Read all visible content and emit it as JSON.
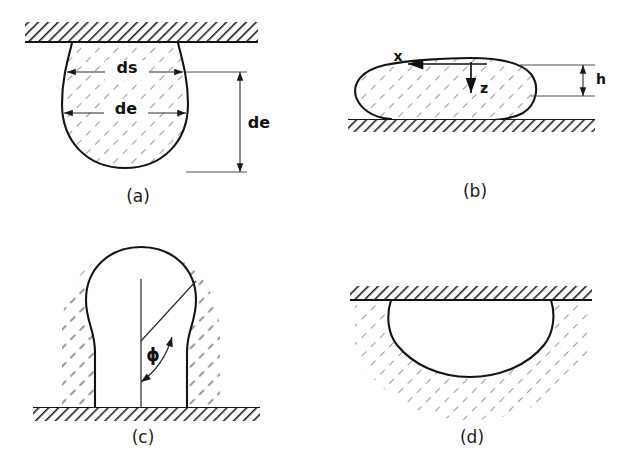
{
  "figure": {
    "width": 623,
    "height": 463,
    "background_color": "#ffffff",
    "outline_color": "#141414",
    "hatch_solid_color": "#1a1a1a",
    "hatch_fluid_color": "#9a9a9a"
  },
  "panels": [
    {
      "id": "a",
      "caption": "(a)",
      "description": "Pendant drop hanging from a horizontal solid surface",
      "labels": [
        {
          "name": "ds",
          "text": "ds"
        },
        {
          "name": "de-horizontal",
          "text": "de"
        },
        {
          "name": "de-vertical",
          "text": "de"
        }
      ]
    },
    {
      "id": "b",
      "caption": "(b)",
      "description": "Sessile drop resting on a horizontal solid surface with coordinate axes",
      "labels": [
        {
          "name": "x-axis",
          "text": "x"
        },
        {
          "name": "z-axis",
          "text": "z"
        },
        {
          "name": "height",
          "text": "h"
        }
      ]
    },
    {
      "id": "c",
      "caption": "(c)",
      "description": "Captive bubble attached to a solid surface in liquid, with angle phi",
      "labels": [
        {
          "name": "phi-angle",
          "text": "ϕ"
        }
      ]
    },
    {
      "id": "d",
      "caption": "(d)",
      "description": "Bubble trapped beneath a horizontal solid ceiling in liquid",
      "labels": []
    }
  ]
}
